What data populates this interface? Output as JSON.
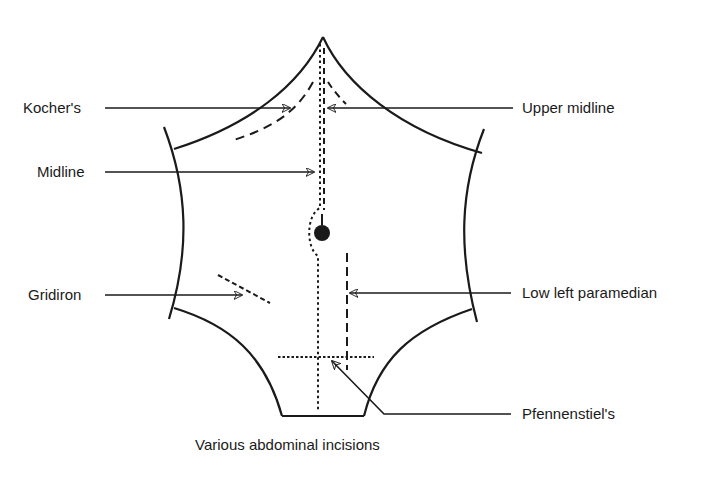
{
  "figure": {
    "caption": "Various abdominal incisions",
    "colors": {
      "ink": "#1a1a1a",
      "background": "#ffffff"
    }
  },
  "labels": {
    "kochers": "Kocher's",
    "upper_midline": "Upper midline",
    "midline": "Midline",
    "gridiron": "Gridiron",
    "low_left_paramedian": "Low left paramedian",
    "pfannenstiel": "Pfennenstiel's"
  },
  "landmarks": {
    "umbilicus": "umbilicus-dot",
    "xiphisternum": "apex",
    "costal_margins": [
      "left-costal-margin",
      "right-costal-margin"
    ],
    "iliac_crests": [
      "left-iliac-crest",
      "right-iliac-crest"
    ],
    "pubis": "pubic-line"
  },
  "incisions": [
    {
      "name": "Kocher's",
      "style": "dashed",
      "side": "right subcostal (viewer left)"
    },
    {
      "name": "Upper midline",
      "style": "dashed",
      "side": "upper midline"
    },
    {
      "name": "Midline",
      "style": "dotted",
      "side": "full midline, skirting umbilicus"
    },
    {
      "name": "Gridiron",
      "style": "dashed",
      "side": "right iliac fossa (viewer left)"
    },
    {
      "name": "Low left paramedian",
      "style": "dashed",
      "side": "left lower (viewer right)"
    },
    {
      "name": "Pfennenstiel's",
      "style": "dotted",
      "side": "transverse suprapubic"
    }
  ]
}
